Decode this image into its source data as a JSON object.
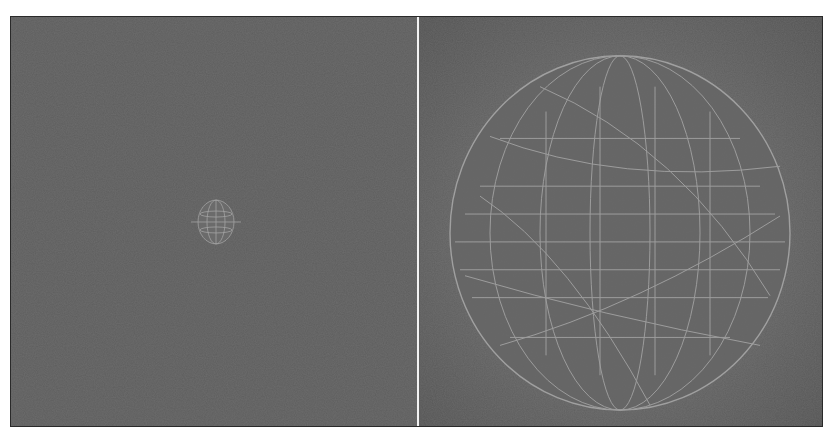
{
  "figure": {
    "panels": [
      {
        "id": "left",
        "content": "small wireframe sphere",
        "sphere": {
          "cx": 205,
          "cy": 206,
          "rx": 18,
          "ry": 22
        }
      },
      {
        "id": "right",
        "content": "large wireframe sphere",
        "sphere": {
          "cx": 200,
          "cy": 217,
          "rx": 170,
          "ry": 178
        }
      }
    ],
    "colors": {
      "background": "#5f5f5f",
      "wireframe": "#a8a8a8",
      "divider": "#f2f2f2",
      "border": "#2a2a2a"
    }
  }
}
